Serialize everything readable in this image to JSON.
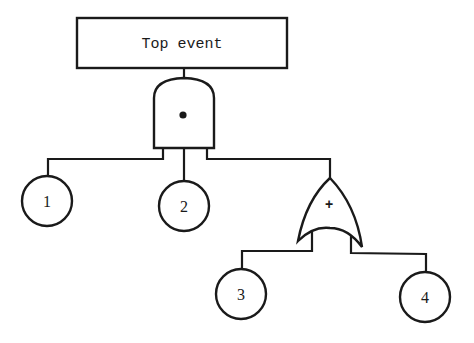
{
  "diagram": {
    "type": "fault-tree",
    "top_event": {
      "label": "Top event"
    },
    "gates": [
      {
        "id": "and-gate",
        "kind": "AND",
        "symbol": "•"
      },
      {
        "id": "or-gate",
        "kind": "OR",
        "symbol": "+"
      }
    ],
    "basic_events": [
      {
        "id": "event-1",
        "label": "1",
        "parent": "and-gate"
      },
      {
        "id": "event-2",
        "label": "2",
        "parent": "and-gate"
      },
      {
        "id": "event-3",
        "label": "3",
        "parent": "or-gate"
      },
      {
        "id": "event-4",
        "label": "4",
        "parent": "or-gate"
      }
    ],
    "colors": {
      "line": "#1a1a1a",
      "background": "#ffffff"
    }
  }
}
